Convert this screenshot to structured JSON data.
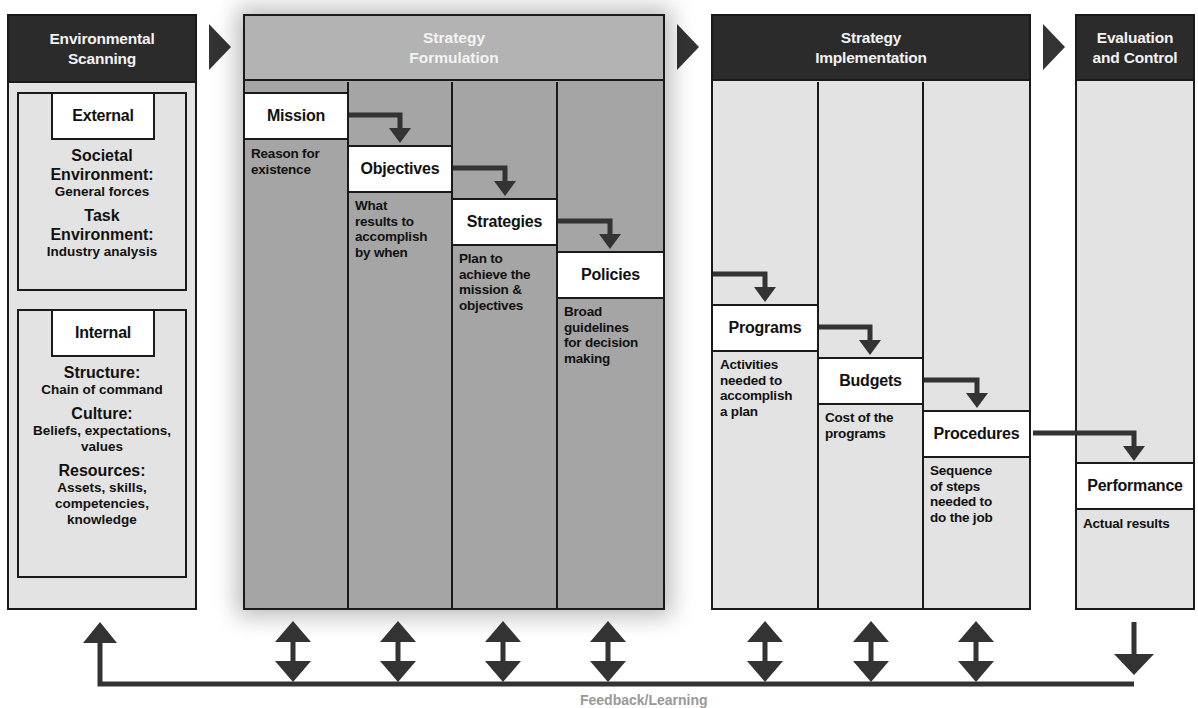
{
  "stages": {
    "environmental_scanning": {
      "title_line1": "Environmental",
      "title_line2": "Scanning",
      "external": {
        "label": "External",
        "societal_title_1": "Societal",
        "societal_title_2": "Environment:",
        "societal_desc": "General forces",
        "task_title_1": "Task",
        "task_title_2": "Environment:",
        "task_desc": "Industry analysis"
      },
      "internal": {
        "label": "Internal",
        "structure_title": "Structure:",
        "structure_desc": "Chain of command",
        "culture_title": "Culture:",
        "culture_desc_1": "Beliefs, expectations,",
        "culture_desc_2": "values",
        "resources_title": "Resources:",
        "resources_desc_1": "Assets, skills,",
        "resources_desc_2": "competencies,",
        "resources_desc_3": "knowledge"
      }
    },
    "strategy_formulation": {
      "title_line1": "Strategy",
      "title_line2": "Formulation",
      "steps": [
        {
          "label": "Mission",
          "desc": [
            "Reason for",
            "existence"
          ]
        },
        {
          "label": "Objectives",
          "desc": [
            "What",
            "results to",
            "accomplish",
            "by when"
          ]
        },
        {
          "label": "Strategies",
          "desc": [
            "Plan to",
            "achieve the",
            "mission &",
            "objectives"
          ]
        },
        {
          "label": "Policies",
          "desc": [
            "Broad",
            "guidelines",
            "for decision",
            "making"
          ]
        }
      ]
    },
    "strategy_implementation": {
      "title_line1": "Strategy",
      "title_line2": "Implementation",
      "steps": [
        {
          "label": "Programs",
          "desc": [
            "Activities",
            "needed to",
            "accomplish",
            "a plan"
          ]
        },
        {
          "label": "Budgets",
          "desc": [
            "Cost of the",
            "programs"
          ]
        },
        {
          "label": "Procedures",
          "desc": [
            "Sequence",
            "of steps",
            "needed to",
            "do the job"
          ]
        }
      ]
    },
    "evaluation_control": {
      "title_line1": "Evaluation",
      "title_line2": "and Control",
      "steps": [
        {
          "label": "Performance",
          "desc": [
            "Actual results"
          ]
        }
      ]
    }
  },
  "feedback": {
    "label": "Feedback/Learning"
  },
  "colors": {
    "dark_header": "#2b2b2b",
    "formulation_fill": "#a5a5a5",
    "formulation_header": "#b3b3b3",
    "light_fill": "#e3e3e3",
    "box_fill": "#ffffff",
    "arrow": "#333333"
  }
}
